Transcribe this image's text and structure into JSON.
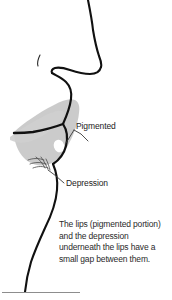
{
  "figure": {
    "colors": {
      "ink": "#111111",
      "lip_fill": "#c8c8c8",
      "highlight": "#ffffff",
      "caption_text": "#2a2a2a",
      "rule": "#8d8d8d",
      "background": "#ffffff"
    },
    "parts": [
      {
        "name": "nose-bridge",
        "label": ""
      },
      {
        "name": "nostril",
        "label": ""
      },
      {
        "name": "upper-lip",
        "label": ""
      },
      {
        "name": "lower-lip",
        "label": ""
      },
      {
        "name": "chin",
        "label": ""
      }
    ]
  },
  "callouts": [
    {
      "id": "pigmented",
      "label": "Pigmented",
      "points_to": "lip-pigmented-region"
    },
    {
      "id": "depression",
      "label": "Depression",
      "points_to": "under-lip-depression"
    }
  ],
  "caption": {
    "text": "The lips (pigmented portion) and the depression underneath the lips have a small gap between them.",
    "lines": [
      "The lips (pigmented",
      "portion) and the",
      "depression underneath the",
      "lips have a small gap",
      "between them."
    ]
  }
}
